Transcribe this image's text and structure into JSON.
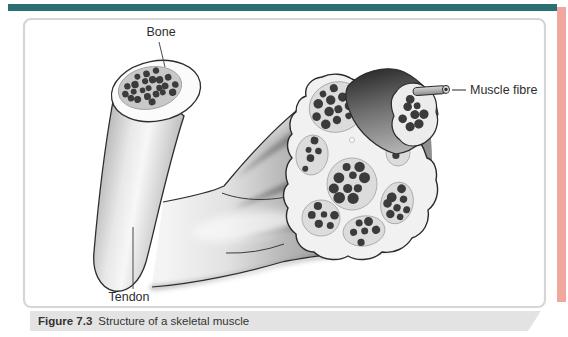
{
  "figure": {
    "caption_prefix": "Figure 7.3",
    "caption_text": "Structure of a skeletal muscle",
    "labels": {
      "bone": "Bone",
      "tendon": "Tendon",
      "muscle_fibre": "Muscle fibre"
    }
  },
  "colors": {
    "top_bar": "#2b6f73",
    "edge_strip": "#f1a69e",
    "caption_band": "#e3e3e3",
    "caption_text": "#333333",
    "label_text": "#2d2d2d",
    "outline": "#2d2d2d",
    "dot": "#3b3b3b",
    "box_border": "#d6d6d6",
    "fascicle_fill": "#dcdcdc",
    "fascicle_edge": "#a8a8a8"
  }
}
